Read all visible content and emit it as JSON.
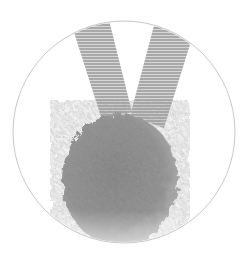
{
  "image": {
    "subject": "gray pompom with gray grosgrain ribbon loop",
    "frame": "circle outline",
    "colors": {
      "background": "#ffffff",
      "circle_stroke": "#c8c8c8",
      "ribbon": "#a9a9a9",
      "ribbon_stripe": "#d9d9d9",
      "pompom": "#8a8a8a",
      "pompom_shadow": "#6e6e6e",
      "pompom_highlight": "#a5a5a5"
    }
  }
}
